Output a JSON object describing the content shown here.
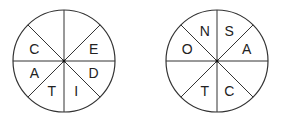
{
  "wheels": [
    {
      "name": "wheel-1",
      "cx": 64,
      "cy": 61,
      "r": 51,
      "sectors": [
        "",
        "E",
        "D",
        "I",
        "T",
        "A",
        "C",
        ""
      ]
    },
    {
      "name": "wheel-2",
      "cx": 217,
      "cy": 61,
      "r": 51,
      "sectors": [
        "S",
        "A",
        "",
        "C",
        "T",
        "",
        "O",
        "N"
      ]
    }
  ],
  "colors": {
    "stroke": "#333333",
    "text": "#222222",
    "background": "#ffffff"
  }
}
